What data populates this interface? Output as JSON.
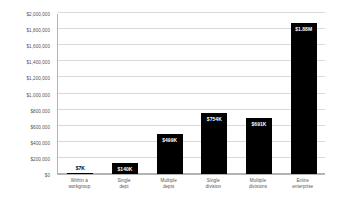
{
  "chart_data": {
    "type": "bar",
    "title": "",
    "xlabel": "",
    "ylabel": "",
    "ylim": [
      0,
      2000000
    ],
    "grid": true,
    "legend": "none",
    "orientation": "vertical",
    "bar_color": "#000000",
    "categories": [
      "Within a workgroup",
      "Single dept",
      "Multiple depts",
      "Single division",
      "Multiple divisions",
      "Entire enterprise"
    ],
    "category_lines": [
      [
        "Within a",
        "workgroup"
      ],
      [
        "Single",
        "dept"
      ],
      [
        "Multiple",
        "depts"
      ],
      [
        "Single",
        "division"
      ],
      [
        "Multiple",
        "divisions"
      ],
      [
        "Entire",
        "enterprise"
      ]
    ],
    "values": [
      7000,
      140000,
      499000,
      754000,
      691000,
      1880000
    ],
    "data_labels": [
      "$7K",
      "$140K",
      "$499K",
      "$754K",
      "$691K",
      "$1.88M"
    ],
    "data_label_placement": [
      "outside",
      "inside",
      "inside",
      "inside",
      "inside",
      "inside"
    ],
    "ytick_values": [
      0,
      200000,
      400000,
      600000,
      800000,
      1000000,
      1200000,
      1400000,
      1600000,
      1800000,
      2000000
    ],
    "ytick_labels": [
      "$0",
      "$200,000",
      "$400,000",
      "$600,000",
      "$800,000",
      "$1,000,000",
      "$1,200,000",
      "$1,400,000",
      "$1,600,000",
      "$1,800,000",
      "$2,000,000"
    ]
  }
}
